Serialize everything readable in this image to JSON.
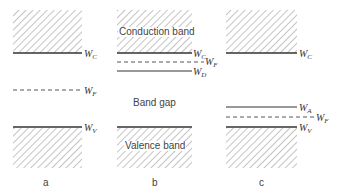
{
  "panels": [
    {
      "id": "a",
      "caption": "a",
      "levels": [
        {
          "symbol": "W",
          "sub": "C",
          "style": "solid",
          "role": "conduction-band-edge"
        },
        {
          "symbol": "W",
          "sub": "F",
          "style": "dashed",
          "role": "fermi-level"
        },
        {
          "symbol": "W",
          "sub": "V",
          "style": "solid",
          "role": "valence-band-edge"
        }
      ]
    },
    {
      "id": "b",
      "caption": "b",
      "band_labels": {
        "conduction": "Conduction band",
        "gap": "Band gap",
        "valence": "Valence band"
      },
      "levels": [
        {
          "symbol": "W",
          "sub": "C",
          "style": "solid",
          "role": "conduction-band-edge"
        },
        {
          "symbol": "W",
          "sub": "F",
          "style": "dashed",
          "role": "fermi-level"
        },
        {
          "symbol": "W",
          "sub": "D",
          "style": "solid",
          "role": "donor-level"
        },
        {
          "symbol": "W",
          "sub": "V",
          "style": "solid",
          "role": "valence-band-edge"
        }
      ]
    },
    {
      "id": "c",
      "caption": "c",
      "levels": [
        {
          "symbol": "W",
          "sub": "C",
          "style": "solid",
          "role": "conduction-band-edge"
        },
        {
          "symbol": "W",
          "sub": "A",
          "style": "solid",
          "role": "acceptor-level"
        },
        {
          "symbol": "W",
          "sub": "F",
          "style": "dashed",
          "role": "fermi-level"
        },
        {
          "symbol": "W",
          "sub": "V",
          "style": "solid",
          "role": "valence-band-edge"
        }
      ]
    }
  ],
  "colors": {
    "line": "#333333",
    "hatch": "#8a8a8a",
    "text": "#444444"
  }
}
